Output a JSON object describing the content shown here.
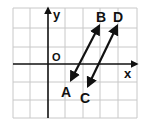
{
  "diagram": {
    "type": "coordinate-plane",
    "grid": {
      "left": 13,
      "top": 8,
      "right": 137,
      "bottom": 118,
      "cols": 7,
      "rows": 6,
      "color": "#c8c8c8"
    },
    "axes": {
      "origin_label": "O",
      "x_label": "x",
      "y_label": "y",
      "color": "#111111"
    },
    "lines": [
      {
        "name": "AB",
        "start_label": "A",
        "end_label": "B",
        "relation": "parallel"
      },
      {
        "name": "CD",
        "start_label": "C",
        "end_label": "D",
        "relation": "parallel"
      }
    ],
    "labels": {
      "A": "A",
      "B": "B",
      "C": "C",
      "D": "D"
    }
  }
}
